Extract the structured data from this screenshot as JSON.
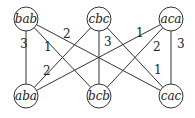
{
  "diagram": {
    "type": "weighted bipartite graph",
    "nodes": [
      {
        "id": "bab",
        "label": "bab",
        "x": 26,
        "y": 19
      },
      {
        "id": "cbc",
        "label": "cbc",
        "x": 99,
        "y": 19
      },
      {
        "id": "aca",
        "label": "aca",
        "x": 171,
        "y": 19
      },
      {
        "id": "aba",
        "label": "aba",
        "x": 26,
        "y": 96
      },
      {
        "id": "bcb",
        "label": "bcb",
        "x": 99,
        "y": 96
      },
      {
        "id": "cac",
        "label": "cac",
        "x": 171,
        "y": 96
      }
    ],
    "edges": [
      {
        "from": "bab",
        "to": "aba",
        "weight": "3",
        "lx": 20,
        "ly": 48
      },
      {
        "from": "bab",
        "to": "bcb",
        "weight": "1",
        "lx": 44,
        "ly": 51
      },
      {
        "from": "bab",
        "to": "cac",
        "weight": "2",
        "lx": 63,
        "ly": 38
      },
      {
        "from": "cbc",
        "to": "aba",
        "weight": "2",
        "lx": 43,
        "ly": 75
      },
      {
        "from": "cbc",
        "to": "bcb",
        "weight": "3",
        "lx": 104,
        "ly": 46
      },
      {
        "from": "cbc",
        "to": "cac",
        "weight": "1",
        "lx": 154,
        "ly": 74
      },
      {
        "from": "aca",
        "to": "aba",
        "weight": "1",
        "lx": 136,
        "ly": 37
      },
      {
        "from": "aca",
        "to": "bcb",
        "weight": "2",
        "lx": 153,
        "ly": 51
      },
      {
        "from": "aca",
        "to": "cac",
        "weight": "3",
        "lx": 177,
        "ly": 48
      }
    ]
  }
}
